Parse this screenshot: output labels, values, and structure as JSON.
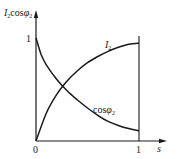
{
  "chart_data": {
    "type": "line",
    "title": "",
    "ylabel": "I₂cosφ₂",
    "xlabel": "s",
    "x_ticks": [
      "0",
      "1"
    ],
    "y_ticks": [
      "1"
    ],
    "xlim": [
      0,
      1
    ],
    "ylim": [
      0,
      1
    ],
    "grid": false,
    "legend": "inline labels on curves",
    "series": [
      {
        "name": "I₂",
        "x": [
          0,
          0.1,
          0.2,
          0.3,
          0.4,
          0.5,
          0.6,
          0.7,
          0.8,
          0.9,
          1.0
        ],
        "values": [
          0,
          0.27,
          0.45,
          0.58,
          0.68,
          0.76,
          0.82,
          0.87,
          0.91,
          0.94,
          0.95
        ]
      },
      {
        "name": "cosφ₂",
        "x": [
          0,
          0.05,
          0.1,
          0.2,
          0.3,
          0.4,
          0.5,
          0.6,
          0.7,
          0.8,
          0.9,
          1.0
        ],
        "values": [
          1.0,
          0.84,
          0.74,
          0.6,
          0.49,
          0.4,
          0.32,
          0.25,
          0.19,
          0.15,
          0.12,
          0.1
        ]
      }
    ],
    "annotations": [
      "I₂",
      "cosφ₂"
    ],
    "line_color": "#1a1a1a"
  },
  "labels": {
    "y_axis_main": "I",
    "y_axis_sub1": "2",
    "y_axis_cos": "cos",
    "y_axis_phi": "φ",
    "y_axis_sub2": "2",
    "y_tick_one": "1",
    "x_tick_zero": "0",
    "x_tick_one": "1",
    "x_axis": "s",
    "curve_i2_main": "I",
    "curve_i2_sub": "2",
    "curve_cos_main": "cos",
    "curve_cos_phi": "φ",
    "curve_cos_sub": "2"
  }
}
